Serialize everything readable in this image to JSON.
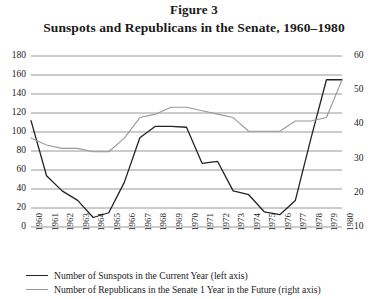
{
  "figure": {
    "label": "Figure 3",
    "title": "Sunspots and Republicans in the Senate, 1960–1980"
  },
  "legend": {
    "items": [
      {
        "label": "Number of Sunspots in the Current Year (left axis)",
        "color": "#232323",
        "series": "sunspots"
      },
      {
        "label": "Number of Republicans in the Senate 1 Year in the Future (right axis)",
        "color": "#9a9a9a",
        "series": "republicans"
      }
    ]
  },
  "axes": {
    "left_ticks": [
      "180",
      "160",
      "140",
      "120",
      "100",
      "80",
      "60",
      "40",
      "20",
      "0"
    ],
    "right_ticks": [
      "60",
      "50",
      "40",
      "30",
      "20",
      "10"
    ],
    "x_ticks": [
      "1960",
      "1961",
      "1962",
      "1963",
      "1964",
      "1965",
      "1966",
      "1967",
      "1968",
      "1969",
      "1970",
      "1971",
      "1972",
      "1973",
      "1974",
      "1975",
      "1976",
      "1977",
      "1978",
      "1979",
      "1980"
    ]
  },
  "chart_data": {
    "type": "line",
    "title": "Sunspots and Republicans in the Senate, 1960–1980",
    "xlabel": "",
    "ylabel": "",
    "grid": true,
    "legend_position": "below",
    "x": [
      1960,
      1961,
      1962,
      1963,
      1964,
      1965,
      1966,
      1967,
      1968,
      1969,
      1970,
      1971,
      1972,
      1973,
      1974,
      1975,
      1976,
      1977,
      1978,
      1979,
      1980
    ],
    "y_left_label": "Number of Sunspots in the Current Year (left axis)",
    "y_right_label": "Number of Republicans in the Senate 1 Year in the Future (right axis)",
    "ylim": [
      0,
      180
    ],
    "ylim_right": [
      10,
      60
    ],
    "ytick_step": 20,
    "ytick_step_right": 10,
    "series": [
      {
        "name": "Number of Sunspots in the Current Year (left axis)",
        "axis": "left",
        "color": "#232323",
        "values": [
          112,
          54,
          38,
          28,
          10,
          15,
          47,
          94,
          106,
          106,
          105,
          67,
          69,
          38,
          34,
          16,
          13,
          28,
          93,
          155,
          155
        ]
      },
      {
        "name": "Number of Republicans in the Senate 1 Year in the Future (right axis)",
        "axis": "right",
        "color": "#9a9a9a",
        "values": [
          36,
          34,
          33,
          33,
          32,
          32,
          36,
          42,
          43,
          45,
          45,
          44,
          43,
          42,
          38,
          38,
          38,
          41,
          41,
          42,
          53
        ]
      }
    ]
  }
}
